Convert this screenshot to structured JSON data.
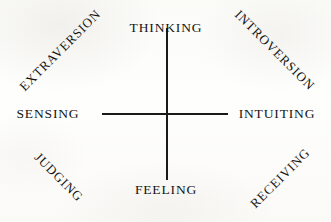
{
  "diagram": {
    "background_color": "#fdfdfb",
    "line_color": "#1a1a1a",
    "text_color": "#141414",
    "axes": {
      "vertical": {
        "label_top": "THINKING",
        "label_bottom": "FEELING"
      },
      "horizontal": {
        "label_left": "SENSING",
        "label_right": "INTUITING"
      }
    },
    "labels": {
      "top": "THINKING",
      "bottom": "FEELING",
      "left": "SENSING",
      "right": "INTUITING",
      "top_left": "EXTRAVERSION",
      "top_right": "INTROVERSION",
      "bottom_left": "JUDGING",
      "bottom_right": "RECEIVING"
    }
  },
  "chart_data": {
    "type": "diagram",
    "subtitle": "",
    "xlabel": "",
    "ylabel": "",
    "axis_poles": [
      {
        "position": "top",
        "label": "THINKING",
        "rotation_deg": 0,
        "x": 166,
        "y": 28
      },
      {
        "position": "bottom",
        "label": "FEELING",
        "rotation_deg": 0,
        "x": 166,
        "y": 190
      },
      {
        "position": "left",
        "label": "SENSING",
        "rotation_deg": 0,
        "x": 48,
        "y": 114
      },
      {
        "position": "right",
        "label": "INTUITING",
        "rotation_deg": 0,
        "x": 277,
        "y": 114
      }
    ],
    "corner_labels": [
      {
        "position": "top-left",
        "label": "EXTRAVERSION",
        "rotation_deg": -45,
        "x": 60,
        "y": 50
      },
      {
        "position": "top-right",
        "label": "INTROVERSION",
        "rotation_deg": 45,
        "x": 275,
        "y": 50
      },
      {
        "position": "bottom-left",
        "label": "JUDGING",
        "rotation_deg": 45,
        "x": 59,
        "y": 177
      },
      {
        "position": "bottom-right",
        "label": "RECEIVING",
        "rotation_deg": -45,
        "x": 280,
        "y": 178
      }
    ],
    "lines": [
      {
        "name": "vertical-axis",
        "x1": 166,
        "y1": 28,
        "x2": 166,
        "y2": 180
      },
      {
        "name": "horizontal-axis",
        "x1": 102,
        "y1": 113,
        "x2": 228,
        "y2": 113
      }
    ],
    "legend": [],
    "grid": false
  }
}
